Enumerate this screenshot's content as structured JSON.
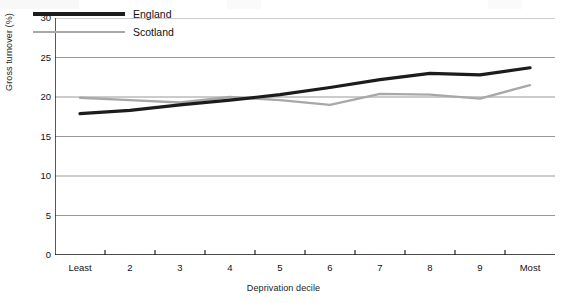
{
  "chart_data": {
    "type": "line",
    "title": "",
    "xlabel": "Deprivation decile",
    "ylabel": "Gross turnover (%)",
    "categories": [
      "Least",
      "2",
      "3",
      "4",
      "5",
      "6",
      "7",
      "8",
      "9",
      "Most"
    ],
    "yticks": [
      "0",
      "5",
      "10",
      "15",
      "20",
      "25",
      "30"
    ],
    "ylim": [
      0,
      30
    ],
    "grid": "horizontal",
    "legend_position": "top-left-inside",
    "series": [
      {
        "name": "England",
        "color": "#1c1c1c",
        "values": [
          17.9,
          18.3,
          19.0,
          19.6,
          20.3,
          21.2,
          22.2,
          23.0,
          22.8,
          23.7
        ]
      },
      {
        "name": "Scotland",
        "color": "#a8a8a8",
        "values": [
          19.9,
          19.6,
          19.3,
          20.0,
          19.6,
          19.0,
          20.4,
          20.3,
          19.8,
          21.5
        ]
      }
    ]
  },
  "legend": {
    "items": [
      {
        "label": "England"
      },
      {
        "label": "Scotland"
      }
    ]
  }
}
